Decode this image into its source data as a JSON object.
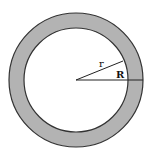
{
  "diagram": {
    "center": {
      "x": 76,
      "y": 80
    },
    "outer_radius_px": 67,
    "inner_radius_px": 52,
    "ring_fill": "#b3b3b3",
    "inner_fill": "#ffffff",
    "stroke": "#333333",
    "labels": {
      "inner_radius": "r",
      "outer_radius": "R"
    },
    "lines": [
      {
        "name": "inner-radius-line",
        "from": [
          76,
          80
        ],
        "to": [
          123,
          61
        ]
      },
      {
        "name": "outer-radius-line",
        "from": [
          76,
          80
        ],
        "to": [
          143,
          80
        ]
      }
    ]
  }
}
